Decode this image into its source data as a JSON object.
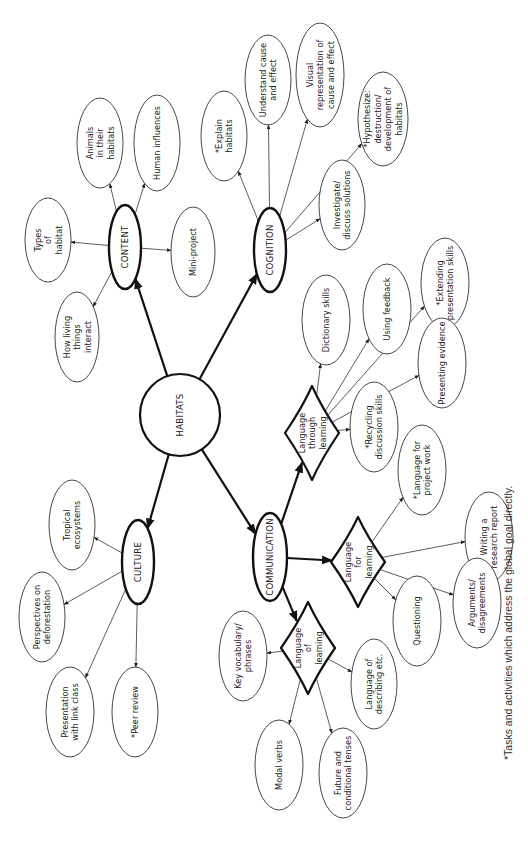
{
  "diagram": {
    "type": "mind-map",
    "orientation": "rotated-90-ccw",
    "root": {
      "id": "habitats",
      "label": "HABITATS"
    },
    "footnote": "*Tasks and activities which address the global goal directly.",
    "branches": [
      {
        "id": "content",
        "label": "CONTENT",
        "shape": "oval",
        "children": [
          {
            "id": "types-of-habitat",
            "lines": [
              "Types",
              "of",
              "habitat"
            ]
          },
          {
            "id": "animals-in-habitats",
            "lines": [
              "Animals",
              "in their",
              "habitats"
            ]
          },
          {
            "id": "human-influences",
            "lines": [
              "Human influences"
            ]
          },
          {
            "id": "mini-project",
            "lines": [
              "Mini-project"
            ]
          },
          {
            "id": "how-living-things-interact",
            "lines": [
              "How living",
              "things",
              "interact"
            ]
          }
        ]
      },
      {
        "id": "cognition",
        "label": "COGNITION",
        "shape": "oval",
        "children": [
          {
            "id": "explain-habitats",
            "lines": [
              "*Explain",
              "habitats"
            ],
            "global_goal": true
          },
          {
            "id": "understand-cause-effect",
            "lines": [
              "Understand cause",
              "and effect"
            ]
          },
          {
            "id": "visual-representation",
            "lines": [
              "Visual",
              "representation of",
              "cause and effect"
            ]
          },
          {
            "id": "hypothesize",
            "lines": [
              "*Hypothesize:",
              "destruction/",
              "development of",
              "habitats"
            ],
            "global_goal": true
          },
          {
            "id": "investigate-solutions",
            "lines": [
              "Investigate/",
              "discuss solutions"
            ]
          }
        ]
      },
      {
        "id": "culture",
        "label": "CULTURE",
        "shape": "oval",
        "children": [
          {
            "id": "tropical-ecosystems",
            "lines": [
              "Tropical",
              "ecosystems"
            ]
          },
          {
            "id": "perspectives-deforestation",
            "lines": [
              "Perspectives on",
              "deforestation"
            ]
          },
          {
            "id": "presentation-link-class",
            "lines": [
              "Presentation",
              "with link class"
            ]
          },
          {
            "id": "peer-review",
            "lines": [
              "*Peer review"
            ],
            "global_goal": true
          }
        ]
      },
      {
        "id": "communication",
        "label": "COMMUNICATION",
        "shape": "oval",
        "children": [
          {
            "id": "language-through-learning",
            "lines": [
              "Language",
              "through",
              "learning"
            ],
            "shape": "diamond",
            "children": [
              {
                "id": "dictionary-skills",
                "lines": [
                  "Dictionary skills"
                ]
              },
              {
                "id": "using-feedback",
                "lines": [
                  "Using feedback"
                ]
              },
              {
                "id": "extending-presentation",
                "lines": [
                  "*Extending",
                  "presentation skills"
                ],
                "global_goal": true
              },
              {
                "id": "presenting-evidence",
                "lines": [
                  "Presenting evidence"
                ]
              },
              {
                "id": "recycling-discussion",
                "lines": [
                  "*Recycling",
                  "discussion skills"
                ],
                "global_goal": true
              }
            ]
          },
          {
            "id": "language-for-learning",
            "lines": [
              "Language",
              "for",
              "learning"
            ],
            "shape": "diamond",
            "children": [
              {
                "id": "language-project-work",
                "lines": [
                  "*Language for",
                  "project work"
                ],
                "global_goal": true
              },
              {
                "id": "writing-research-report",
                "lines": [
                  "Writing a",
                  "research report"
                ]
              },
              {
                "id": "arguments-disagreements",
                "lines": [
                  "Arguments/",
                  "disagreements"
                ]
              },
              {
                "id": "questioning",
                "lines": [
                  "Questioning"
                ]
              }
            ]
          },
          {
            "id": "language-of-learning",
            "lines": [
              "Language",
              "of",
              "learning"
            ],
            "shape": "diamond",
            "children": [
              {
                "id": "language-describing",
                "lines": [
                  "Language of",
                  "describing etc."
                ]
              },
              {
                "id": "key-vocabulary",
                "lines": [
                  "Key vocabulary/",
                  "phrases"
                ]
              },
              {
                "id": "modal-verbs",
                "lines": [
                  "Modal verbs"
                ]
              },
              {
                "id": "future-conditional",
                "lines": [
                  "Future and",
                  "conditional tenses"
                ]
              }
            ]
          }
        ]
      }
    ]
  }
}
